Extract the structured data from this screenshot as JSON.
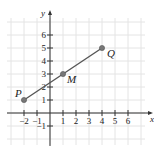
{
  "chart_data": {
    "type": "line",
    "title": "",
    "xlabel": "x",
    "ylabel": "y",
    "xlim": [
      -3,
      7
    ],
    "ylim": [
      -2,
      7
    ],
    "grid": true,
    "x_ticks": [
      -2,
      -1,
      1,
      2,
      3,
      4,
      5,
      6
    ],
    "y_ticks": [
      -1,
      1,
      2,
      3,
      4,
      5,
      6
    ],
    "x_tick_labels": [
      "−2",
      "−1",
      "1",
      "2",
      "3",
      "4",
      "5",
      "6"
    ],
    "y_tick_labels": [
      "−1",
      "1",
      "2",
      "3",
      "4",
      "5",
      "6"
    ],
    "series": [
      {
        "name": "segment PQ",
        "points": [
          {
            "label": "P",
            "x": -2,
            "y": 1
          },
          {
            "label": "M",
            "x": 1,
            "y": 3
          },
          {
            "label": "Q",
            "x": 4,
            "y": 5
          }
        ]
      }
    ],
    "annotations": [
      "P",
      "M",
      "Q"
    ]
  }
}
